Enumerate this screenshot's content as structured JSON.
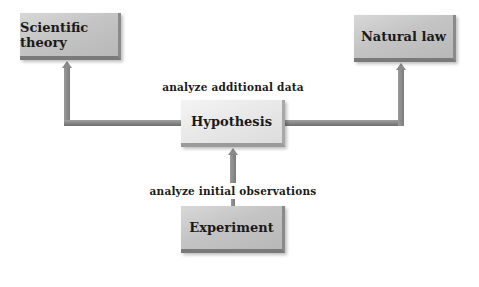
{
  "diagram": {
    "nodes": {
      "scientific_theory": "Scientific theory",
      "natural_law": "Natural law",
      "hypothesis": "Hypothesis",
      "experiment": "Experiment"
    },
    "edge_labels": {
      "hypothesis_to_outcomes": "analyze additional data",
      "experiment_to_hypothesis": "analyze initial observations"
    },
    "edges": [
      {
        "from": "Experiment",
        "to": "Hypothesis",
        "label": "analyze initial observations"
      },
      {
        "from": "Hypothesis",
        "to": "Scientific theory",
        "label": "analyze additional data"
      },
      {
        "from": "Hypothesis",
        "to": "Natural law",
        "label": "analyze additional data"
      }
    ],
    "colors": {
      "box_gray": "#c4c4c4",
      "box_light": "#e8e8e8",
      "connector": "#888888",
      "text": "#1a1a1a"
    }
  }
}
